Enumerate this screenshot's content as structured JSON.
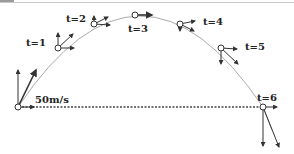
{
  "diagram": {
    "title": "",
    "launch_speed_label": "50m/s",
    "points": [
      {
        "label": "t=0",
        "x": 18,
        "y": 107
      },
      {
        "label": "t=1",
        "x": 58,
        "y": 48
      },
      {
        "label": "t=2",
        "x": 94,
        "y": 24
      },
      {
        "label": "t=3",
        "x": 135,
        "y": 15
      },
      {
        "label": "t=4",
        "x": 180,
        "y": 24
      },
      {
        "label": "t=5",
        "x": 221,
        "y": 48
      },
      {
        "label": "t=6",
        "x": 263,
        "y": 107
      }
    ],
    "labels": {
      "t1": "t=1",
      "t2": "t=2",
      "t3": "t=3",
      "t4": "t=4",
      "t5": "t=5",
      "t6": "t=6"
    },
    "colors": {
      "trajectory": "#aaaaaa",
      "vectors": "#333333",
      "dashed": "#444444"
    }
  }
}
